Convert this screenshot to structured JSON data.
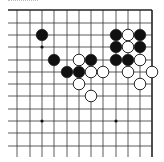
{
  "board": {
    "columns_x": [
      17,
      30,
      42,
      54,
      67,
      79,
      91,
      103,
      116,
      128,
      140,
      152
    ],
    "rows_y": [
      10,
      23,
      35,
      47,
      60,
      72,
      84,
      96,
      109,
      121,
      133,
      146
    ],
    "extend_bottom_to": 157,
    "extend_left_to": 8,
    "edges": {
      "top": true,
      "right": true,
      "left": false,
      "bottom": false
    },
    "line_color": "#333333",
    "border_color": "#222222",
    "stone_radius": 5.8
  },
  "star_points": [
    {
      "c": 2,
      "r": 3
    },
    {
      "c": 2,
      "r": 9
    },
    {
      "c": 8,
      "r": 9
    }
  ],
  "stones": [
    {
      "color": "black",
      "c": 2,
      "r": 2
    },
    {
      "color": "black",
      "c": 8,
      "r": 2
    },
    {
      "color": "white",
      "c": 9,
      "r": 2
    },
    {
      "color": "black",
      "c": 10,
      "r": 2
    },
    {
      "color": "black",
      "c": 8,
      "r": 3
    },
    {
      "color": "white",
      "c": 9,
      "r": 3
    },
    {
      "color": "black",
      "c": 10,
      "r": 3
    },
    {
      "color": "black",
      "c": 3,
      "r": 4
    },
    {
      "color": "white",
      "c": 5,
      "r": 4
    },
    {
      "color": "black",
      "c": 6,
      "r": 4
    },
    {
      "color": "black",
      "c": 8,
      "r": 4
    },
    {
      "color": "black",
      "c": 9,
      "r": 4
    },
    {
      "color": "white",
      "c": 10,
      "r": 4
    },
    {
      "color": "black",
      "c": 4,
      "r": 5
    },
    {
      "color": "black",
      "c": 5,
      "r": 5
    },
    {
      "color": "white",
      "c": 6,
      "r": 5
    },
    {
      "color": "white",
      "c": 7,
      "r": 5
    },
    {
      "color": "white",
      "c": 9,
      "r": 5
    },
    {
      "color": "white",
      "c": 11,
      "r": 5
    },
    {
      "color": "white",
      "c": 5,
      "r": 6
    },
    {
      "color": "white",
      "c": 10,
      "r": 6
    },
    {
      "color": "white",
      "c": 6,
      "r": 7
    }
  ]
}
